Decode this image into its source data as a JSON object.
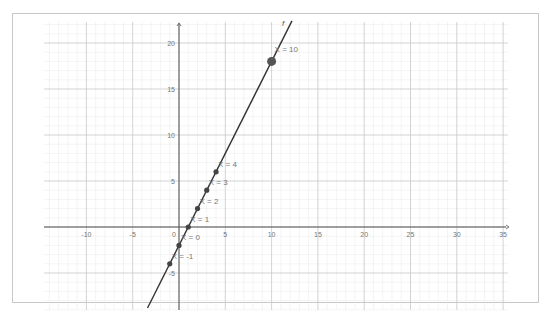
{
  "chart_data": {
    "type": "line",
    "title": "",
    "xlabel": "",
    "ylabel": "",
    "xlim": [
      -14.5,
      35.5
    ],
    "ylim": [
      -8.5,
      22
    ],
    "grid": true,
    "x_ticks": [
      -10,
      -5,
      0,
      5,
      10,
      15,
      20,
      25,
      30,
      35
    ],
    "y_ticks": [
      -5,
      0,
      5,
      10,
      15,
      20
    ],
    "x_tick_labels": [
      "-10",
      "-5",
      "0",
      "5",
      "10",
      "15",
      "20",
      "25",
      "30",
      "35"
    ],
    "y_tick_labels": [
      "-5",
      "0",
      "5",
      "10",
      "15",
      "20"
    ],
    "function": {
      "name": "f",
      "expression": "f(x) = 2x - 2",
      "x_range": [
        -3.4,
        12.2
      ]
    },
    "series": [
      {
        "name": "points",
        "x": [
          -1,
          0,
          1,
          2,
          3,
          4,
          10
        ],
        "y": [
          -4,
          -2,
          0,
          2,
          4,
          6,
          18
        ],
        "labels": [
          "X = -1",
          "X = 0",
          "X = 1",
          "X = 2",
          "X = 3",
          "X = 4",
          "X = 10"
        ]
      }
    ],
    "legend": "none"
  },
  "colors": {
    "line": "#333333",
    "point": "#444444",
    "highlight_point": "#555555",
    "axis": "#555555",
    "major_grid": "#c8c8c8",
    "minor_grid": "#ececec"
  }
}
